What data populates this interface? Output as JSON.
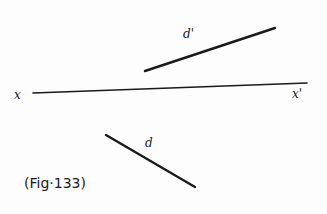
{
  "figure": {
    "caption": "(Fig·133)",
    "colors": {
      "ink": "#1a1a1a",
      "background": "#fdfdfd"
    }
  },
  "ground_line": {
    "label_left": "x",
    "label_right": "x'",
    "x1": 33,
    "y1": 93,
    "x2": 307,
    "y2": 83
  },
  "line_front": {
    "label": "d'",
    "x1": 145,
    "y1": 71,
    "x2": 275,
    "y2": 28,
    "label_x": 183,
    "label_y": 38
  },
  "line_top": {
    "label": "d",
    "x1": 106,
    "y1": 135,
    "x2": 195,
    "y2": 187,
    "label_x": 145,
    "label_y": 147
  }
}
